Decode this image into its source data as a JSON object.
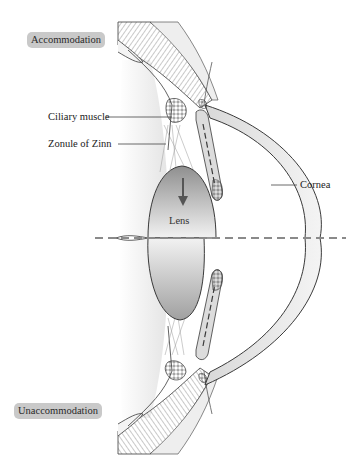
{
  "figure": {
    "states": {
      "top": "Accommodation",
      "bottom": "Unaccommodation"
    },
    "labels": {
      "ciliary_muscle": "Ciliary muscle",
      "zonule": "Zonule of Zinn",
      "lens": "Lens",
      "cornea": "Cornea"
    },
    "axis": {
      "style": "dashed",
      "color": "#8a8a8a"
    },
    "arrow": {
      "direction": "down",
      "meaning": "lens-flattening-direction"
    },
    "colors": {
      "chip_bg": "#c9c9c9",
      "outline": "#3a3a3a",
      "lens_dark": "#9a9a9a",
      "lens_light": "#f0f0f0",
      "cornea_fill": "#e6e6e6"
    }
  }
}
